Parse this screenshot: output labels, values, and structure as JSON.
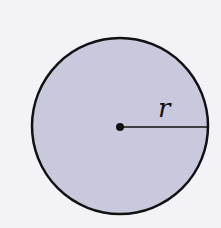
{
  "diagram": {
    "shape": "circle",
    "radius_label": "r",
    "colors": {
      "background": "#f3f3f7",
      "fill": "#c9c9dd",
      "stroke": "#111111"
    },
    "geometry": {
      "cx": 120,
      "cy": 126,
      "r": 88
    }
  }
}
